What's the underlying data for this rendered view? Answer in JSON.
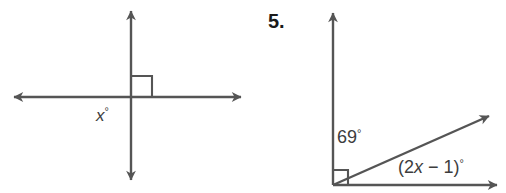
{
  "page": {
    "background_color": "#ffffff",
    "stroke_color": "#555555",
    "text_color": "#3d3d3d",
    "number_color": "#1a1a1a"
  },
  "problem": {
    "number_label": "5."
  },
  "figures": [
    {
      "id": "figure-left",
      "name": "intersecting-perpendicular-lines",
      "description": "Two perpendicular lines intersecting with a right angle mark in the upper right quadrant",
      "vertex": {
        "x": 131,
        "y": 97
      },
      "right_angle_mark": {
        "size": 21,
        "quadrant": "upper-right"
      },
      "lines": [
        {
          "name": "horizontal-line",
          "x1": 10,
          "y1": 97,
          "x2": 245,
          "y2": 97,
          "arrow_start": true,
          "arrow_end": true
        },
        {
          "name": "vertical-line",
          "x1": 131,
          "y1": 6,
          "x2": 131,
          "y2": 185,
          "arrow_start": true,
          "arrow_end": true
        }
      ],
      "labels": [
        {
          "name": "angle-x-label",
          "text": "x",
          "suffix": "°",
          "italic": true,
          "x": 96,
          "y": 121,
          "font_size": 17
        }
      ]
    },
    {
      "id": "figure-right",
      "name": "right-angle-with-ray",
      "description": "A vertical ray and a horizontal ray forming a right angle at the vertex, with a slanted ray between them splitting the right angle into 69 degrees and (2x - 1) degrees",
      "vertex": {
        "x": 333,
        "y": 185
      },
      "right_angle_mark": {
        "size": 15,
        "quadrant": "upper-right"
      },
      "rays": [
        {
          "name": "vertical-ray",
          "x1": 333,
          "y1": 185,
          "x2": 333,
          "y2": 8,
          "arrow_end": true
        },
        {
          "name": "horizontal-ray",
          "x1": 333,
          "y1": 185,
          "x2": 502,
          "y2": 185,
          "arrow_end": true
        },
        {
          "name": "slanted-ray",
          "x1": 333,
          "y1": 185,
          "x2": 494,
          "y2": 114,
          "arrow_end": true
        }
      ],
      "labels": [
        {
          "name": "angle-69-label",
          "text": "69°",
          "italic": false,
          "x": 337,
          "y": 143,
          "font_size": 18
        },
        {
          "name": "angle-expression-label",
          "text_prefix": "(2",
          "text_variable": "x",
          "text_middle": " − 1)",
          "text_suffix": "°",
          "full_text": "(2x − 1)°",
          "x": 398,
          "y": 173,
          "font_size": 18
        }
      ]
    }
  ]
}
